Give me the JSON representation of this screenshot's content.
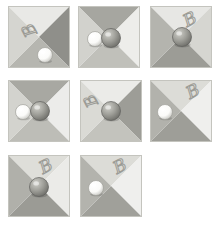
{
  "image": {
    "title": "Four-quadrant shaded square stimuli with spheres and handwritten B markings",
    "background_color": "#ffffff",
    "width": 223,
    "height": 225,
    "grid": {
      "columns": 3,
      "rows": 3,
      "tile_count": 8
    }
  },
  "palette": {
    "quadrant_lightest": "#eeeeec",
    "quadrant_light": "#d8d8d4",
    "quadrant_mid": "#b8b8b2",
    "quadrant_dark": "#9a9a94",
    "quadrant_darkest": "#8a8a86",
    "sphere_white": "#fbfbf9",
    "sphere_white_shadow": "#c9c9c4",
    "sphere_gray_highlight": "#cfcfc9",
    "sphere_gray_body": "#9d9d97",
    "sphere_gray_shadow": "#6e6e69",
    "letter_ink": "#9b9b95",
    "tile_edge": "#c4c4be"
  },
  "tiles": [
    {
      "id": "tile-1",
      "label": "tile-1",
      "x": 8,
      "y": 6,
      "size": 62,
      "quadrants": {
        "top": "#e9e9e6",
        "right": "#8f8f8a",
        "bottom": "#b6b6b0",
        "left": "#d5d5d0"
      },
      "letter": {
        "present": true,
        "glyph": "B",
        "x": 16,
        "y": 34,
        "rotation": -118,
        "size": 15
      },
      "spheres": [
        {
          "type": "white",
          "cx": 37,
          "cy": 49,
          "r": 7.5
        }
      ]
    },
    {
      "id": "tile-2",
      "label": "tile-2",
      "x": 78,
      "y": 6,
      "size": 62,
      "quadrants": {
        "top": "#a6a6a0",
        "right": "#ededea",
        "bottom": "#c0c0ba",
        "left": "#d2d2cd"
      },
      "letter": {
        "present": false,
        "glyph": "",
        "x": 0,
        "y": 0,
        "rotation": 0,
        "size": 0
      },
      "spheres": [
        {
          "type": "white",
          "cx": 17,
          "cy": 33,
          "r": 7.5
        },
        {
          "type": "gray",
          "cx": 33,
          "cy": 32,
          "r": 9.5
        }
      ]
    },
    {
      "id": "tile-3",
      "label": "tile-3",
      "x": 150,
      "y": 6,
      "size": 62,
      "quadrants": {
        "top": "#e7e7e4",
        "right": "#d6d6d1",
        "bottom": "#9c9c96",
        "left": "#b4b4ae"
      },
      "letter": {
        "present": true,
        "glyph": "B",
        "x": 30,
        "y": 8,
        "rotation": -28,
        "size": 15
      },
      "spheres": [
        {
          "type": "gray",
          "cx": 32,
          "cy": 31,
          "r": 9.5
        }
      ]
    },
    {
      "id": "tile-4",
      "label": "tile-4",
      "x": 8,
      "y": 80,
      "size": 62,
      "quadrants": {
        "top": "#a8a8a2",
        "right": "#ececea",
        "bottom": "#bdbdb7",
        "left": "#d3d3ce"
      },
      "letter": {
        "present": false,
        "glyph": "",
        "x": 0,
        "y": 0,
        "rotation": 0,
        "size": 0
      },
      "spheres": [
        {
          "type": "white",
          "cx": 15,
          "cy": 32,
          "r": 7.5
        },
        {
          "type": "gray",
          "cx": 32,
          "cy": 31,
          "r": 9.5
        }
      ]
    },
    {
      "id": "tile-5",
      "label": "tile-5",
      "x": 80,
      "y": 80,
      "size": 62,
      "quadrants": {
        "top": "#ebebe8",
        "right": "#9d9d97",
        "bottom": "#c3c3bd",
        "left": "#dadad5"
      },
      "letter": {
        "present": true,
        "glyph": "B",
        "x": 6,
        "y": 30,
        "rotation": -118,
        "size": 14
      },
      "spheres": [
        {
          "type": "gray",
          "cx": 31,
          "cy": 31,
          "r": 9.5
        }
      ]
    },
    {
      "id": "tile-6",
      "label": "tile-6",
      "x": 150,
      "y": 80,
      "size": 62,
      "quadrants": {
        "top": "#dcdcd7",
        "right": "#efefed",
        "bottom": "#9e9e98",
        "left": "#b2b2ac"
      },
      "letter": {
        "present": true,
        "glyph": "B",
        "x": 33,
        "y": 6,
        "rotation": -28,
        "size": 15
      },
      "spheres": [
        {
          "type": "white",
          "cx": 15,
          "cy": 32,
          "r": 7.5
        }
      ]
    },
    {
      "id": "tile-7",
      "label": "tile-7",
      "x": 8,
      "y": 155,
      "size": 62,
      "quadrants": {
        "top": "#dedeD9",
        "right": "#ebebe8",
        "bottom": "#9b9b95",
        "left": "#b0b0aa"
      },
      "letter": {
        "present": true,
        "glyph": "B",
        "x": 28,
        "y": 6,
        "rotation": -28,
        "size": 15
      },
      "spheres": [
        {
          "type": "gray",
          "cx": 31,
          "cy": 32,
          "r": 9.5
        }
      ]
    },
    {
      "id": "tile-8",
      "label": "tile-8",
      "x": 80,
      "y": 155,
      "size": 62,
      "quadrants": {
        "top": "#dcdcd7",
        "right": "#efefed",
        "bottom": "#a0a09a",
        "left": "#b3b3ad"
      },
      "letter": {
        "present": true,
        "glyph": "B",
        "x": 30,
        "y": 6,
        "rotation": -28,
        "size": 15
      },
      "spheres": [
        {
          "type": "white",
          "cx": 16,
          "cy": 33,
          "r": 7.5
        }
      ]
    }
  ]
}
